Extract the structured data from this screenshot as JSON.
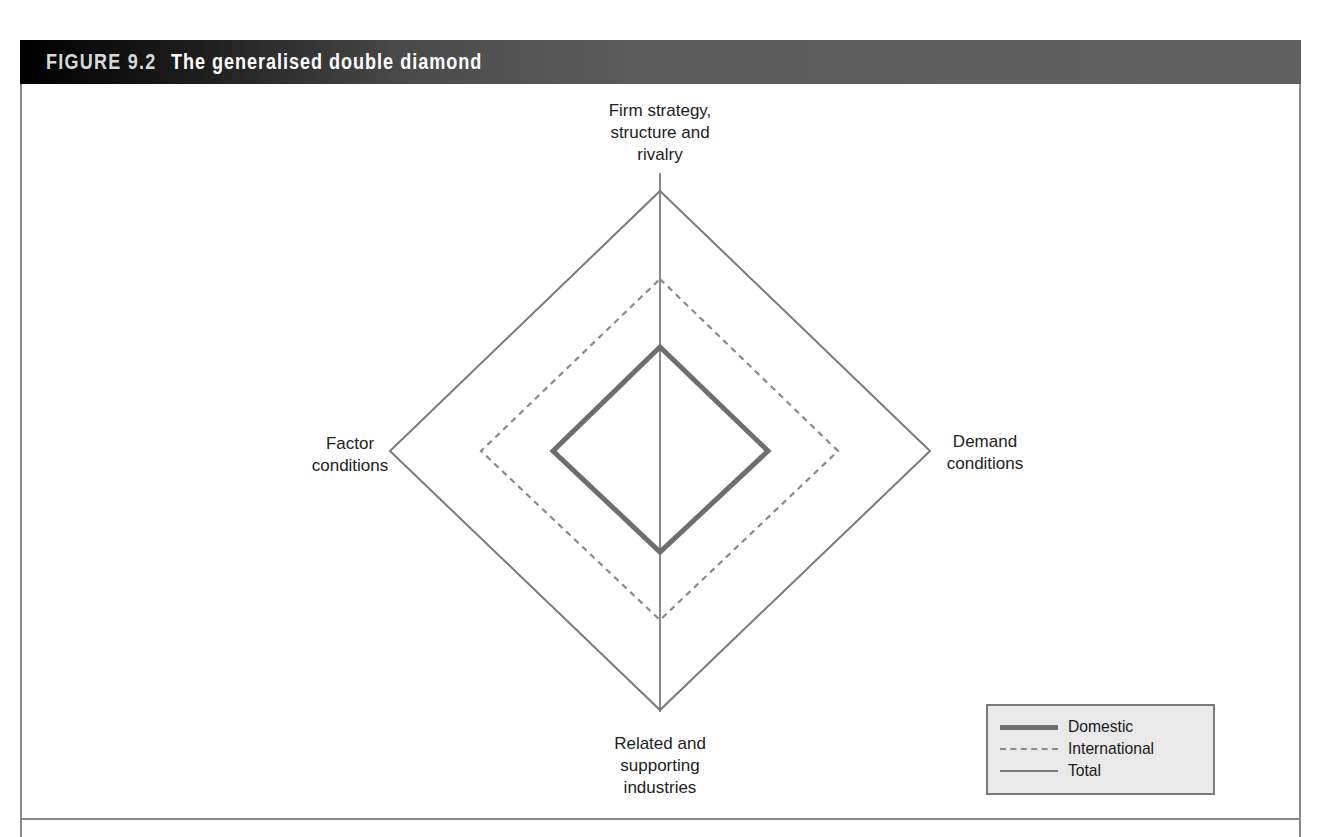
{
  "figure": {
    "number": "FIGURE 9.2",
    "title": "The generalised double diamond"
  },
  "diagram": {
    "type": "double-diamond",
    "center": [
      660,
      451
    ],
    "axis_labels": {
      "top": "Firm strategy,\nstructure and\nrivalry",
      "right": "Demand\nconditions",
      "bottom": "Related and\nsupporting\nindustries",
      "left": "Factor\nconditions"
    },
    "diamonds": [
      {
        "name": "Total",
        "style": "solid-thin",
        "color": "#7a7a7a",
        "top": 191,
        "right": 930,
        "bottom": 710,
        "left": 390
      },
      {
        "name": "International",
        "style": "dashed",
        "color": "#8a8a8a",
        "top": 279,
        "right": 838,
        "bottom": 620,
        "left": 481
      },
      {
        "name": "Domestic",
        "style": "solid-thick",
        "color": "#6e6e6e",
        "top": 347,
        "right": 768,
        "bottom": 552,
        "left": 553
      }
    ]
  },
  "legend": {
    "items": [
      {
        "label": "Domestic",
        "style": "solid-thick"
      },
      {
        "label": "International",
        "style": "dashed"
      },
      {
        "label": "Total",
        "style": "solid-thin"
      }
    ]
  },
  "colors": {
    "header_dark": "#000000",
    "header_light": "#606060",
    "frame": "#8a8a8a",
    "legend_bg": "#e9e9e9"
  }
}
